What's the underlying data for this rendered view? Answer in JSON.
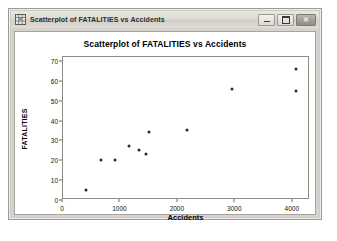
{
  "window": {
    "title": "Scatterplot of FATALITIES vs Accidents",
    "icon": "graph-window-icon",
    "controls": {
      "minimize_label": "–",
      "maximize_label": "□",
      "close_label": "✕"
    }
  },
  "chart_data": {
    "type": "scatter",
    "title": "Scatterplot of FATALITIES vs Accidents",
    "xlabel": "Accidents",
    "ylabel": "FATALITIES",
    "xlim": [
      0,
      4300
    ],
    "ylim": [
      0,
      72
    ],
    "xticks": [
      0,
      1000,
      2000,
      3000,
      4000
    ],
    "xtick_labels": [
      "0",
      "1000",
      "2000",
      "3000",
      "4000"
    ],
    "yticks": [
      0,
      10,
      20,
      30,
      40,
      50,
      60,
      70
    ],
    "ytick_labels": [
      "0",
      "10",
      "20",
      "30",
      "40",
      "50",
      "60",
      "70"
    ],
    "grid": false,
    "legend": null,
    "marker": "filled-circle",
    "marker_color": "#2a2a2a",
    "points": [
      {
        "x": 400,
        "y": 5
      },
      {
        "x": 660,
        "y": 20
      },
      {
        "x": 910,
        "y": 20
      },
      {
        "x": 1150,
        "y": 27
      },
      {
        "x": 1320,
        "y": 25
      },
      {
        "x": 1450,
        "y": 23
      },
      {
        "x": 1500,
        "y": 34
      },
      {
        "x": 2150,
        "y": 35
      },
      {
        "x": 2950,
        "y": 56
      },
      {
        "x": 4050,
        "y": 66
      },
      {
        "x": 4050,
        "y": 55
      }
    ]
  },
  "colors": {
    "window_chrome": "#d6d3ce",
    "plot_background": "#ffffff",
    "axis": "#8f8c88",
    "text": "#000000"
  }
}
